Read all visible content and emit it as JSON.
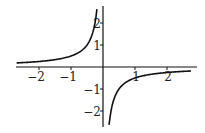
{
  "chart_data": {
    "type": "line",
    "title": "",
    "xlabel": "",
    "ylabel": "",
    "function": "y = -1/(2x)",
    "xlim": [
      -2.7,
      2.95
    ],
    "ylim": [
      -2.6,
      2.3
    ],
    "grid": false,
    "legend": null,
    "x_ticks": [
      -2,
      -1,
      1,
      2
    ],
    "x_tick_labels": [
      "-2",
      "-1",
      "1",
      "2"
    ],
    "y_ticks": [
      2,
      1,
      -1,
      -2
    ],
    "y_tick_labels": [
      "2",
      "1",
      "-1",
      "-2"
    ],
    "series": [
      {
        "name": "left branch",
        "x": [
          -2.7,
          -2,
          -1.5,
          -1,
          -0.75,
          -0.5,
          -0.35,
          -0.25,
          -0.2
        ],
        "y": [
          0.185,
          0.25,
          0.333,
          0.5,
          0.667,
          1.0,
          1.429,
          2.0,
          2.5
        ]
      },
      {
        "name": "right branch",
        "x": [
          0.19,
          0.25,
          0.35,
          0.5,
          0.75,
          1,
          1.5,
          2,
          2.75
        ],
        "y": [
          -2.63,
          -2.0,
          -1.429,
          -1.0,
          -0.667,
          -0.5,
          -0.333,
          -0.25,
          -0.182
        ]
      }
    ],
    "colors": {
      "curve": "#111111",
      "axis": "#111111",
      "background": "#ffffff"
    }
  }
}
